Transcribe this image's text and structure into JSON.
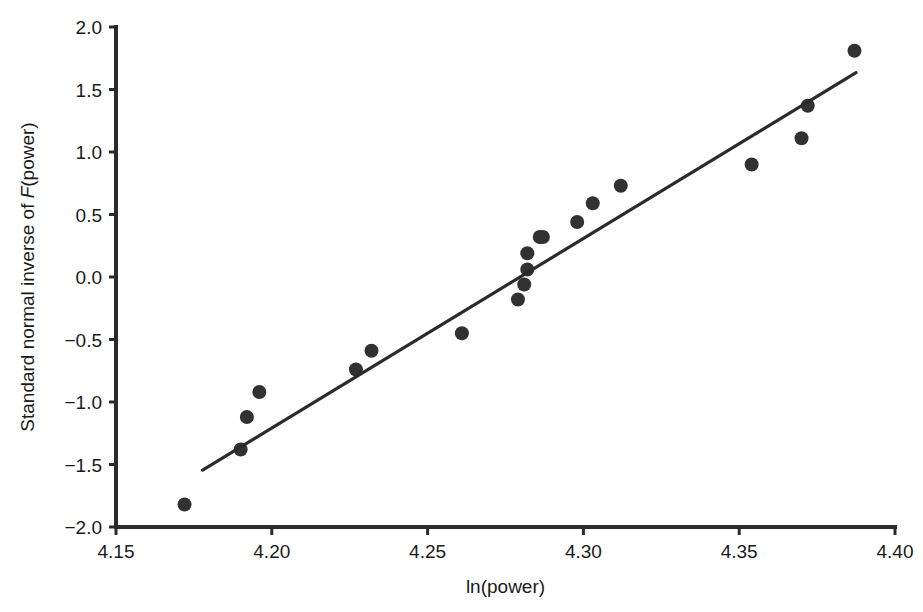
{
  "chart_data": {
    "type": "scatter",
    "title": "",
    "subtitle": "",
    "xlabel": "ln(power)",
    "ylabel_prefix": "Standard normal inverse of ",
    "ylabel_italic": "F",
    "ylabel_suffix": "(power)",
    "ylabel_full": "Standard normal inverse of F(power)",
    "xlim": [
      4.15,
      4.4
    ],
    "ylim": [
      -2.0,
      2.0
    ],
    "xticks": [
      4.15,
      4.2,
      4.25,
      4.3,
      4.35,
      4.4
    ],
    "xticklabels": [
      "4.15",
      "4.20",
      "4.25",
      "4.30",
      "4.35",
      "4.40"
    ],
    "yticks": [
      -2.0,
      -1.5,
      -1.0,
      -0.5,
      0.0,
      0.5,
      1.0,
      1.5,
      2.0
    ],
    "yticklabels": [
      "−2.0",
      "−1.5",
      "−1.0",
      "−0.5",
      "0.0",
      "0.5",
      "1.0",
      "1.5",
      "2.0"
    ],
    "grid": false,
    "legend": null,
    "marker_color": "#313131",
    "line_color": "#2b2b2b",
    "axis_color": "#2b2b2b",
    "marker_radius": 7,
    "series": [
      {
        "name": "probability plot points",
        "kind": "scatter",
        "x": [
          4.172,
          4.19,
          4.192,
          4.196,
          4.227,
          4.232,
          4.261,
          4.279,
          4.281,
          4.282,
          4.282,
          4.286,
          4.287,
          4.298,
          4.303,
          4.312,
          4.354,
          4.37,
          4.372,
          4.387
        ],
        "y": [
          -1.82,
          -1.38,
          -1.12,
          -0.92,
          -0.74,
          -0.59,
          -0.45,
          -0.18,
          -0.06,
          0.06,
          0.19,
          0.32,
          0.32,
          0.44,
          0.59,
          0.73,
          0.9,
          1.11,
          1.37,
          1.81
        ]
      },
      {
        "name": "reference fit line",
        "kind": "line",
        "x": [
          4.1778,
          4.3875
        ],
        "y": [
          -1.545,
          1.635
        ]
      }
    ]
  }
}
